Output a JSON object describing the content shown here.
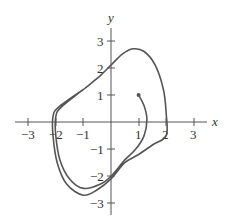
{
  "chart_data": {
    "type": "line",
    "title": "",
    "xlabel": "x",
    "ylabel": "y",
    "xlim": [
      -3.4,
      3.4
    ],
    "ylim": [
      -3.4,
      3.4
    ],
    "grid": false,
    "x_ticks": [
      "−3",
      "−2",
      "−1",
      "1",
      "2",
      "3"
    ],
    "y_ticks": [
      "3",
      "2",
      "1",
      "−1",
      "−2",
      "−3"
    ],
    "series": [
      {
        "name": "trajectory",
        "start_point": [
          1,
          1
        ],
        "points": [
          [
            1,
            1
          ],
          [
            1.2,
            0.6
          ],
          [
            1.3,
            0.1
          ],
          [
            1.2,
            -0.5
          ],
          [
            0.9,
            -1.0
          ],
          [
            0.5,
            -1.4
          ],
          [
            0,
            -2.0
          ],
          [
            -0.4,
            -2.3
          ],
          [
            -1.0,
            -2.45
          ],
          [
            -1.5,
            -2.1
          ],
          [
            -1.85,
            -1.4
          ],
          [
            -2.0,
            -0.5
          ],
          [
            -2.0,
            0.2
          ],
          [
            -1.8,
            0.55
          ],
          [
            -1.0,
            1.2
          ],
          [
            -0.4,
            1.7
          ],
          [
            0,
            2.1
          ],
          [
            0.4,
            2.5
          ],
          [
            0.8,
            2.7
          ],
          [
            1.2,
            2.6
          ],
          [
            1.6,
            2.1
          ],
          [
            1.9,
            1.2
          ],
          [
            2.0,
            0.3
          ],
          [
            2.0,
            -0.5
          ],
          [
            1.5,
            -0.85
          ],
          [
            1.0,
            -1.2
          ],
          [
            0.5,
            -1.5
          ],
          [
            0,
            -2.1
          ],
          [
            -0.5,
            -2.5
          ],
          [
            -1.0,
            -2.7
          ],
          [
            -1.6,
            -2.3
          ],
          [
            -1.95,
            -1.5
          ],
          [
            -2.1,
            -0.5
          ],
          [
            -2.1,
            0.2
          ],
          [
            -1.9,
            0.55
          ],
          [
            -1.0,
            1.2
          ]
        ]
      }
    ]
  },
  "axes": {
    "x_label": "x",
    "y_label": "y"
  }
}
